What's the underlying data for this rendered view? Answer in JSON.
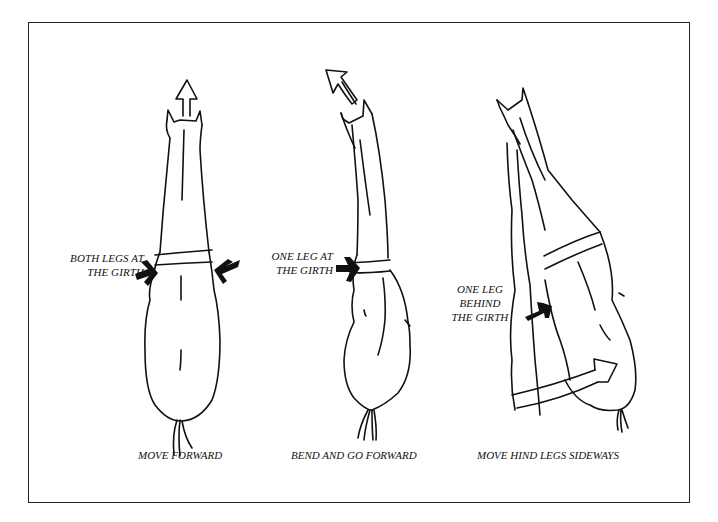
{
  "figure": {
    "panels": [
      {
        "id": "move-forward",
        "annotation": [
          "BOTH LEGS AT",
          "THE GIRTH"
        ],
        "caption": "MOVE FORWARD",
        "direction_arrow": "up"
      },
      {
        "id": "bend-forward",
        "annotation": [
          "ONE LEG AT",
          "THE GIRTH"
        ],
        "caption": "BEND AND GO FORWARD",
        "direction_arrow": "up-left"
      },
      {
        "id": "hind-sideways",
        "annotation": [
          "ONE LEG",
          "BEHIND",
          "THE GIRTH"
        ],
        "caption": "MOVE HIND LEGS SIDEWAYS",
        "direction_arrow": "right"
      }
    ]
  },
  "colors": {
    "ink": "#111111",
    "background": "#ffffff",
    "border": "#222222"
  }
}
